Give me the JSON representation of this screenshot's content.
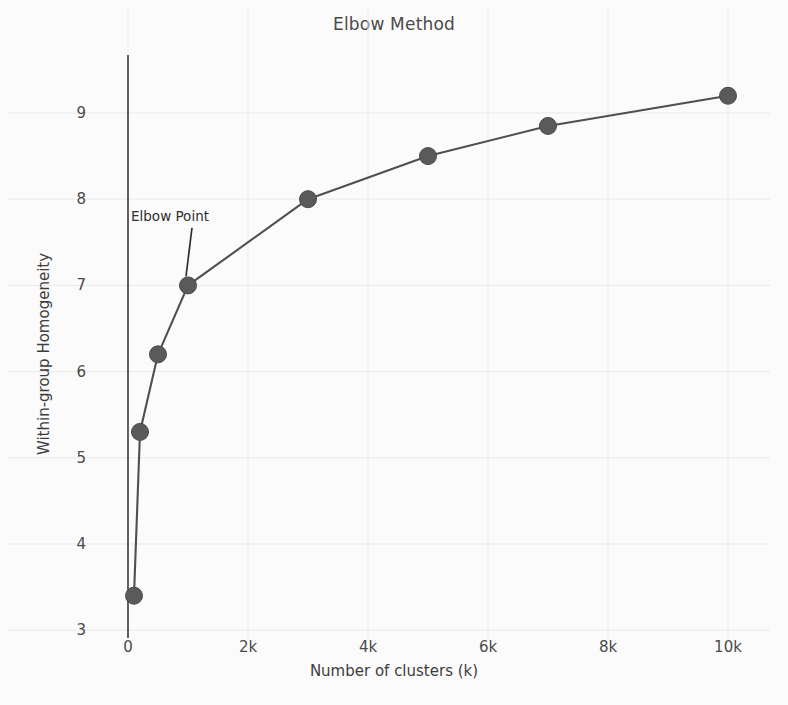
{
  "chart_data": {
    "type": "line",
    "title": "Elbow Method",
    "xlabel": "Number of clusters (k)",
    "ylabel": "Within-group Homogeneity",
    "x": [
      100,
      200,
      500,
      1000,
      3000,
      5000,
      7000,
      10000
    ],
    "values": [
      3.4,
      5.3,
      6.2,
      7.0,
      8.0,
      8.5,
      8.85,
      9.2
    ],
    "series": [
      {
        "name": "Within-group Homogeneity",
        "values": [
          3.4,
          5.3,
          6.2,
          7.0,
          8.0,
          8.5,
          8.85,
          9.2
        ]
      }
    ],
    "xlim": [
      -200,
      11000
    ],
    "ylim": [
      3,
      9.45
    ],
    "xticks": [
      0,
      2000,
      4000,
      6000,
      8000,
      10000
    ],
    "xticklabels": [
      "0",
      "2k",
      "4k",
      "6k",
      "8k",
      "10k"
    ],
    "yticks": [
      3,
      4,
      5,
      6,
      7,
      8,
      9
    ],
    "yticklabels": [
      "3",
      "4",
      "5",
      "6",
      "7",
      "8",
      "9"
    ],
    "grid": true,
    "legend": "none",
    "annotations": [
      {
        "text": "Elbow Point",
        "point_x": 1000,
        "point_y": 7.0,
        "label_x": 700,
        "label_y": 7.75
      }
    ],
    "colors": {
      "line": "#4f4f4f",
      "marker": "#5a5a5a",
      "grid": "#e9e9ea",
      "axis": "#3a3a3a",
      "background": "#fbfbfb",
      "text": "#4a4a4a"
    }
  }
}
